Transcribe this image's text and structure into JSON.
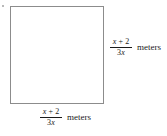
{
  "figure": {
    "bullet_marker": "•",
    "shape": {
      "name": "square",
      "stroke_color": "#8c8c8c",
      "fill_color": "#ffffff"
    },
    "labels": [
      {
        "position": "right",
        "numerator": "x + 2",
        "denominator": "3x",
        "unit": "meters"
      },
      {
        "position": "bottom",
        "numerator": "x + 2",
        "denominator": "3x",
        "unit": "meters"
      }
    ]
  }
}
